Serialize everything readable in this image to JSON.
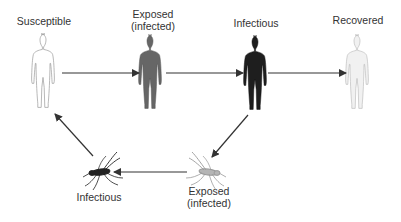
{
  "nodes": {
    "human_susceptible": {
      "label": "Susceptible",
      "fill": "#ffffff",
      "stroke": "#9a9a9a"
    },
    "human_exposed": {
      "label_line1": "Exposed",
      "label_line2": "(infected)",
      "fill": "#666666",
      "stroke": "#555555"
    },
    "human_infectious": {
      "label": "Infectious",
      "fill": "#1e1e1e",
      "stroke": "#111111"
    },
    "human_recovered": {
      "label": "Recovered",
      "fill": "#f1f1f1",
      "stroke": "#b5b5b5"
    },
    "mosquito_exposed": {
      "label_line1": "Exposed",
      "label_line2": "(infected)",
      "color": "#9a9a9a"
    },
    "mosquito_infectious": {
      "label": "Infectious",
      "color": "#222222"
    }
  },
  "edges": [
    {
      "from": "human_susceptible",
      "to": "human_exposed"
    },
    {
      "from": "human_exposed",
      "to": "human_infectious"
    },
    {
      "from": "human_infectious",
      "to": "human_recovered"
    },
    {
      "from": "human_infectious",
      "to": "mosquito_exposed"
    },
    {
      "from": "mosquito_exposed",
      "to": "mosquito_infectious"
    },
    {
      "from": "mosquito_infectious",
      "to": "human_susceptible"
    }
  ],
  "colors": {
    "arrow": "#333333",
    "text": "#333333"
  }
}
